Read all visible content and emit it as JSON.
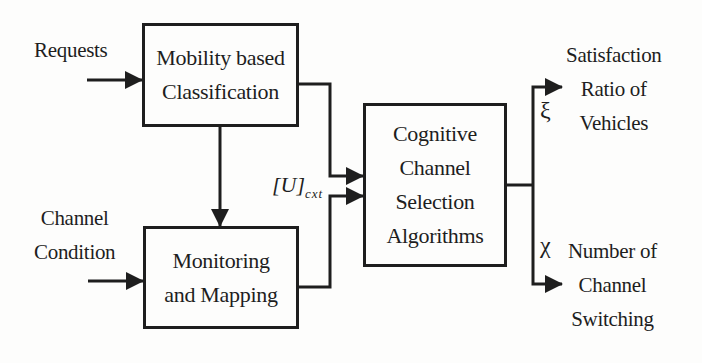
{
  "diagram": {
    "inputs": {
      "requests": "Requests",
      "channel_condition": [
        "Channel",
        "Condition"
      ]
    },
    "blocks": {
      "classification": [
        "Mobility based",
        "Classification"
      ],
      "monitoring": [
        "Monitoring",
        "and Mapping"
      ],
      "selection": [
        "Cognitive",
        "Channel",
        "Selection",
        "Algorithms"
      ]
    },
    "intermediate": {
      "matrix_symbol": "[U]",
      "matrix_subscript": "cxt"
    },
    "outputs": {
      "satisfaction": {
        "symbol": "ξ",
        "label": [
          "Satisfaction",
          "Ratio of",
          "Vehicles"
        ]
      },
      "switching": {
        "symbol": "χ",
        "label": [
          "Number of",
          "Channel",
          "Switching"
        ]
      }
    },
    "colors": {
      "line": "#1e1e1e",
      "background": "#fdfdfc"
    }
  }
}
